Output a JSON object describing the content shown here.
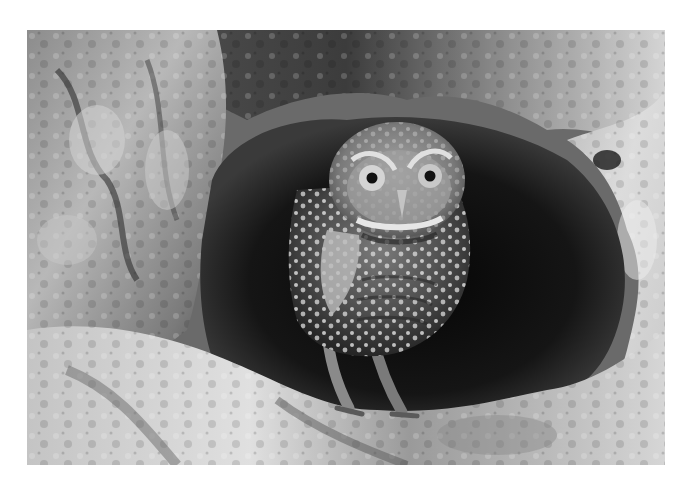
{
  "image": {
    "subject": "Burrowing owl standing at the entrance of a rock burrow",
    "style": "black-and-white photograph",
    "colors": {
      "background": "#ffffff",
      "burrow_dark": "#0a0a0a",
      "rock_light": "#d8d8d8",
      "rock_mid": "#9a9a9a",
      "rock_shadow": "#3a3a3a",
      "owl_body": "#5a5a5a",
      "owl_spots": "#e6e6e6",
      "eye_iris": "#cfcfcf",
      "eye_pupil": "#111111"
    }
  }
}
